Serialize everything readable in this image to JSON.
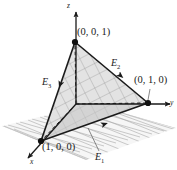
{
  "figure": {
    "background_color": "#ffffff",
    "line_color": "#1a1a1a",
    "grid_color": "#9a9a9a",
    "face_fill": "#d8d8d8"
  },
  "axes": [
    {
      "name": "z-axis",
      "label": "z",
      "direction": "up"
    },
    {
      "name": "y-axis",
      "label": "y",
      "direction": "right"
    },
    {
      "name": "x-axis",
      "label": "x",
      "direction": "down-left"
    }
  ],
  "vertices": [
    {
      "name": "vertex-z",
      "label": "(0, 0, 1)",
      "coords": [
        0,
        0,
        1
      ],
      "px": [
        75,
        42
      ]
    },
    {
      "name": "vertex-y",
      "label": "(0, 1, 0)",
      "coords": [
        0,
        1,
        0
      ],
      "px": [
        148,
        103
      ]
    },
    {
      "name": "vertex-x",
      "label": "(1, 0, 0)",
      "coords": [
        1,
        0,
        0
      ],
      "px": [
        41,
        141
      ]
    }
  ],
  "edges": [
    {
      "name": "edge-E1",
      "label": "E",
      "sub": "1",
      "from": "(1, 0, 0)",
      "to": "(0, 1, 0)"
    },
    {
      "name": "edge-E2",
      "label": "E",
      "sub": "2",
      "from": "(0, 0, 1)",
      "to": "(0, 1, 0)"
    },
    {
      "name": "edge-E3",
      "label": "E",
      "sub": "3",
      "from": "(0, 0, 1)",
      "to": "(1, 0, 0)"
    }
  ],
  "annotations": {
    "ground_plane": "xy-grid-plane",
    "hidden_lines": "dashed projections from origin",
    "face_texture": "cross-hatched grid on simplex face"
  }
}
